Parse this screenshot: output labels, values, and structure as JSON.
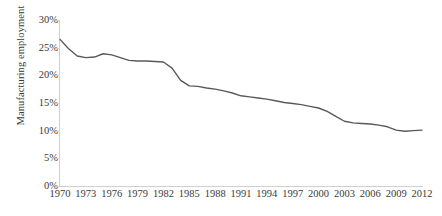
{
  "chart_data": {
    "type": "line",
    "title": "",
    "xlabel": "",
    "ylabel": "Manufacturing employment",
    "xlim": [
      1970,
      2012
    ],
    "ylim": [
      0,
      30
    ],
    "grid": false,
    "legend": null,
    "line_color": "#595959",
    "axis_color": "#d0d0d0",
    "text_color": "#3a3a3a",
    "y_tick_labels": [
      "30%",
      "25%",
      "20%",
      "15%",
      "10%",
      "5%",
      "0%"
    ],
    "y_tick_values": [
      30,
      25,
      20,
      15,
      10,
      5,
      0
    ],
    "x_tick_labels": [
      "1970",
      "1973",
      "1976",
      "1979",
      "1982",
      "1985",
      "1988",
      "1991",
      "1994",
      "1997",
      "2000",
      "2003",
      "2006",
      "2009",
      "2012"
    ],
    "x_tick_values": [
      1970,
      1973,
      1976,
      1979,
      1982,
      1985,
      1988,
      1991,
      1994,
      1997,
      2000,
      2003,
      2006,
      2009,
      2012
    ],
    "x": [
      1970,
      1971,
      1972,
      1973,
      1974,
      1975,
      1976,
      1977,
      1978,
      1979,
      1980,
      1981,
      1982,
      1983,
      1984,
      1985,
      1986,
      1987,
      1988,
      1989,
      1990,
      1991,
      1992,
      1993,
      1994,
      1995,
      1996,
      1997,
      1998,
      1999,
      2000,
      2001,
      2002,
      2003,
      2004,
      2005,
      2006,
      2007,
      2008,
      2009,
      2010,
      2011,
      2012
    ],
    "values": [
      26.5,
      24.8,
      23.5,
      23.2,
      23.3,
      23.9,
      23.7,
      23.2,
      22.7,
      22.6,
      22.6,
      22.5,
      22.4,
      21.3,
      19.1,
      18.1,
      18.0,
      17.7,
      17.5,
      17.2,
      16.8,
      16.3,
      16.1,
      15.9,
      15.7,
      15.4,
      15.1,
      14.9,
      14.7,
      14.4,
      14.1,
      13.5,
      12.6,
      11.7,
      11.4,
      11.3,
      11.2,
      11.0,
      10.7,
      10.1,
      9.9,
      10.0,
      10.1
    ],
    "series_name": "Manufacturing employment share"
  }
}
